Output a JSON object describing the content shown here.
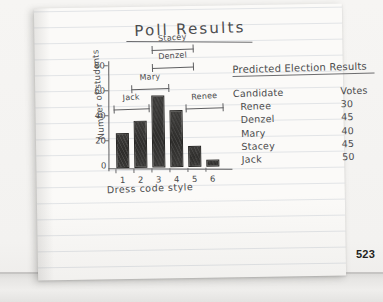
{
  "page": {
    "number": "523",
    "title": "Poll Results"
  },
  "chart_data": {
    "type": "bar",
    "title": "Poll Results",
    "xlabel": "Dress code style",
    "ylabel": "Number of students",
    "categories": [
      "1",
      "2",
      "3",
      "4",
      "5",
      "6"
    ],
    "values": [
      28,
      38,
      58,
      46,
      17,
      6
    ],
    "ylim": [
      0,
      80
    ],
    "yticks": [
      "0",
      "20",
      "40",
      "60",
      "80"
    ],
    "grid": false,
    "legend": "none",
    "annotations": [
      {
        "label": "Jack",
        "spans": [
          "1",
          "2"
        ],
        "tier": 1
      },
      {
        "label": "Mary",
        "spans": [
          "2",
          "3"
        ],
        "tier": 2
      },
      {
        "label": "Denzel",
        "spans": [
          "3",
          "4"
        ],
        "tier": 3
      },
      {
        "label": "Stacey",
        "spans": [
          "3",
          "4"
        ],
        "tier": 4
      },
      {
        "label": "Renee",
        "spans": [
          "5",
          "6"
        ],
        "tier": 1
      }
    ]
  },
  "table": {
    "heading": "Predicted Election Results",
    "columns": [
      "Candidate",
      "Votes"
    ],
    "rows": [
      {
        "candidate": "Renee",
        "votes": "30"
      },
      {
        "candidate": "Denzel",
        "votes": "45"
      },
      {
        "candidate": "Mary",
        "votes": "40"
      },
      {
        "candidate": "Stacey",
        "votes": "45"
      },
      {
        "candidate": "Jack",
        "votes": "50"
      }
    ]
  },
  "axis": {
    "y_ticks": [
      "80",
      "60",
      "40",
      "20",
      "0"
    ]
  },
  "brackets": {
    "jack": "Jack",
    "mary": "Mary",
    "denzel": "Denzel",
    "stacey": "Stacey",
    "renee": "Renee"
  }
}
